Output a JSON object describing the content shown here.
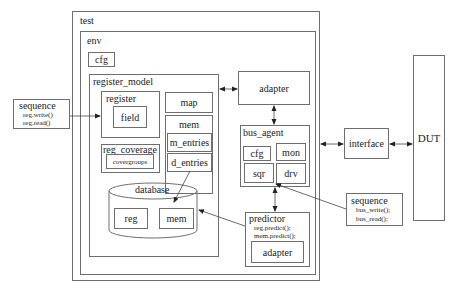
{
  "diagram": {
    "test": {
      "label": "test"
    },
    "env": {
      "label": "env",
      "cfg": "cfg"
    },
    "register_model": {
      "label": "register_model",
      "register": {
        "label": "register",
        "field": "field"
      },
      "map": "map",
      "mem": {
        "label": "mem",
        "m_entries": "m_entries",
        "d_entries": "d_entries"
      },
      "reg_coverage": {
        "label": "reg_coverage",
        "covergroups": "covergroups"
      },
      "database": {
        "label": "database",
        "reg": "reg",
        "mem": "mem"
      }
    },
    "adapter": "adapter",
    "bus_agent": {
      "label": "bus_agent",
      "cfg": "cfg",
      "mon": "mon",
      "sqr": "sqr",
      "drv": "drv"
    },
    "predictor": {
      "label": "predictor",
      "line1": "reg.predict();",
      "line2": "mem.predict();",
      "adapter": "adapter"
    },
    "sequence_left": {
      "label": "sequence",
      "line1": "reg.write()",
      "line2": "reg.read()"
    },
    "sequence_right": {
      "label": "sequence",
      "line1": "bus_write();",
      "line2": "bus_read();"
    },
    "interface": "interface",
    "dut": "DUT"
  }
}
